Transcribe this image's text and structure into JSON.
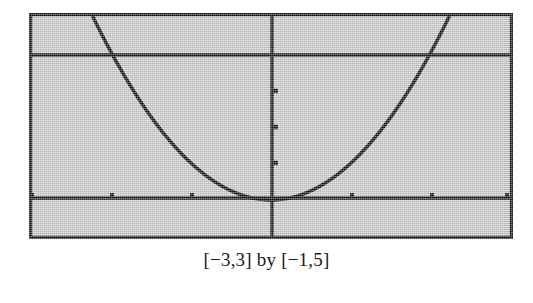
{
  "figure": {
    "caption": "[−3,3] by [−1,5]",
    "screen": {
      "background_color": "#c9c9c9",
      "border_color": "#111111"
    }
  },
  "chart_data": {
    "type": "line",
    "title": "",
    "subtitle": "",
    "xlabel": "",
    "ylabel": "",
    "function": "y = x^2",
    "xlim": [
      -3,
      3
    ],
    "ylim": [
      -1,
      5
    ],
    "grid": false,
    "legend": null,
    "axes": {
      "x_axis_at_y": 0,
      "y_axis_at_x": 0,
      "x_tick_spacing": 1,
      "y_tick_spacing": 1,
      "x_ticks": [
        -3,
        -2,
        -1,
        1,
        2,
        3
      ],
      "y_ticks": [
        1,
        2,
        3
      ],
      "x_tick_labels": [
        "",
        "",
        "",
        "",
        "",
        ""
      ],
      "y_tick_labels": [
        "",
        "",
        ""
      ]
    },
    "extra_lines": [
      {
        "name": "upper-horizontal-line",
        "orientation": "horizontal",
        "y": 4
      }
    ],
    "x": [
      -3,
      -2.8,
      -2.6,
      -2.4,
      -2.2,
      -2,
      -1.8,
      -1.6,
      -1.4,
      -1.2,
      -1,
      -0.8,
      -0.6,
      -0.4,
      -0.2,
      0,
      0.2,
      0.4,
      0.6,
      0.8,
      1,
      1.2,
      1.4,
      1.6,
      1.8,
      2,
      2.2,
      2.4,
      2.6,
      2.8,
      3
    ],
    "values": [
      9,
      7.84,
      6.76,
      5.76,
      4.84,
      4,
      3.24,
      2.56,
      1.96,
      1.44,
      1,
      0.64,
      0.36,
      0.16,
      0.04,
      0,
      0.04,
      0.16,
      0.36,
      0.64,
      1,
      1.44,
      1.96,
      2.56,
      3.24,
      4,
      4.84,
      5.76,
      6.76,
      7.84,
      9
    ],
    "annotations": [
      "[−3,3] by [−1,5]"
    ]
  }
}
